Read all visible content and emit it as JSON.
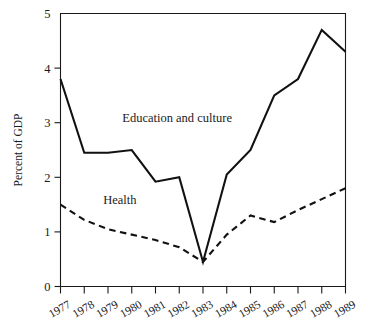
{
  "chart_data": {
    "type": "line",
    "title": "",
    "xlabel": "",
    "ylabel": "Percent of GDP",
    "grid": false,
    "legend_position": "inline-annotation",
    "ylim": [
      0,
      5
    ],
    "yticks": [
      "0",
      "1",
      "2",
      "3",
      "4",
      "5"
    ],
    "ytick_values": [
      0,
      1,
      2,
      3,
      4,
      5
    ],
    "categories": [
      "1977",
      "1978",
      "1979",
      "1980",
      "1981",
      "1982",
      "1983",
      "1984",
      "1985",
      "1986",
      "1987",
      "1988",
      "1989"
    ],
    "x": [
      1977,
      1978,
      1979,
      1980,
      1981,
      1982,
      1983,
      1984,
      1985,
      1986,
      1987,
      1988,
      1989
    ],
    "series": [
      {
        "name": "Education and culture",
        "style": "solid",
        "color": "#111111",
        "values": [
          3.8,
          2.45,
          2.45,
          2.5,
          1.92,
          2.0,
          0.45,
          2.05,
          2.5,
          3.5,
          3.8,
          4.7,
          4.3
        ]
      },
      {
        "name": "Health",
        "style": "dashed",
        "color": "#111111",
        "values": [
          1.5,
          1.22,
          1.05,
          0.95,
          0.85,
          0.72,
          0.45,
          0.95,
          1.3,
          1.18,
          1.4,
          1.6,
          1.8
        ]
      }
    ],
    "annotations": [
      {
        "text": "Education and culture",
        "x": 1979.6,
        "y": 3.02
      },
      {
        "text": "Health",
        "x": 1978.8,
        "y": 1.52
      }
    ]
  },
  "axes": {
    "y_axis_title": "Percent of GDP"
  }
}
